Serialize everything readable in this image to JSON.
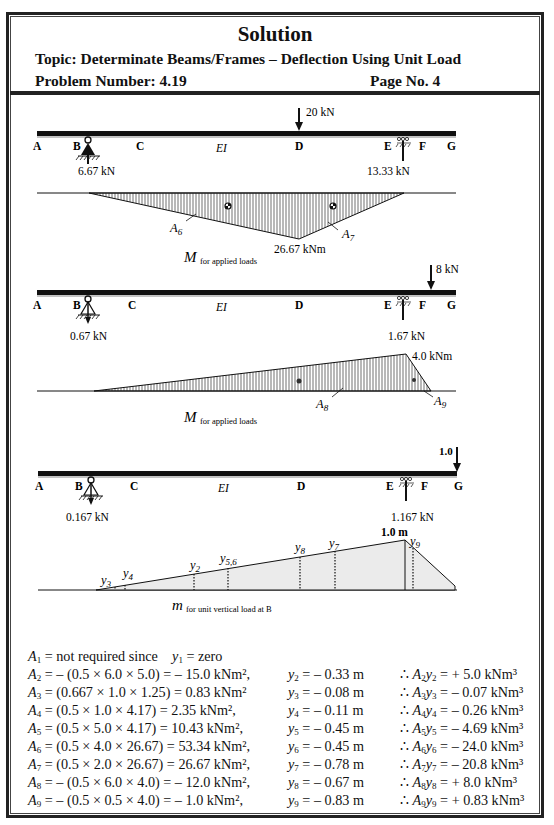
{
  "header": {
    "title": "Solution",
    "topic": "Topic:  Determinate Beams/Frames – Deflection Using Unit Load",
    "problem_number": "Problem Number: 4.19",
    "page_no": "Page No. 4"
  },
  "figures": {
    "fig1": {
      "load_label": "20 kN",
      "node_labels": [
        "A",
        "B",
        "C",
        "EI",
        "D",
        "E",
        "F",
        "G"
      ],
      "reaction_b": "6.67 kN",
      "reaction_e": "13.33 kN",
      "peak_moment": "26.67 kNm",
      "area_labels": [
        "A6",
        "A7"
      ],
      "caption_main": "M",
      "caption_sub": "for applied loads"
    },
    "fig2": {
      "load_label": "8 kN",
      "node_labels": [
        "A",
        "B",
        "C",
        "EI",
        "D",
        "E",
        "F",
        "G"
      ],
      "reaction_b": "0.67 kN",
      "reaction_e": "1.67 kN",
      "peak_moment": "4.0 kNm",
      "area_labels": [
        "A8",
        "A9"
      ],
      "caption_main": "M",
      "caption_sub": "for applied loads"
    },
    "fig3": {
      "load_label": "1.0",
      "node_labels": [
        "A",
        "B",
        "C",
        "EI",
        "D",
        "E",
        "F",
        "G"
      ],
      "reaction_b": "0.167 kN",
      "reaction_e": "1.167 kN",
      "peak_moment": "1.0 m",
      "ordinate_labels": [
        "y3",
        "y4",
        "y2",
        "y5,6",
        "y8",
        "y7",
        "y9"
      ],
      "caption_main": "m",
      "caption_sub": "for unit vertical load at B"
    }
  },
  "equations": {
    "areas": [
      {
        "lhs": "A1",
        "rhs": "= not required since",
        "extra": "y1 = zero"
      },
      {
        "lhs": "A2",
        "rhs": "= – (0.5 × 6.0 × 5.0) = – 15.0 kNm², "
      },
      {
        "lhs": "A3",
        "rhs": "= (0.667 × 1.0 × 1.25) = 0.83 kNm²"
      },
      {
        "lhs": "A4",
        "rhs": "= (0.5 × 1.0 × 4.17) = 2.35 kNm², "
      },
      {
        "lhs": "A5",
        "rhs": "= (0.5 × 5.0 × 4.17) = 10.43 kNm², "
      },
      {
        "lhs": "A6",
        "rhs": "= (0.5 × 4.0  × 26.67) = 53.34 kNm², "
      },
      {
        "lhs": "A7",
        "rhs": "= (0.5 × 2.0 × 26.67) = 26.67 kNm², "
      },
      {
        "lhs": "A8",
        "rhs": "= – (0.5 × 6.0 × 4.0) = – 12.0 kNm², "
      },
      {
        "lhs": "A9",
        "rhs": "= – (0.5 × 0.5 × 4.0) = – 1.0 kNm², "
      }
    ],
    "ordinates": [
      {
        "lhs": "y2",
        "rhs": "= – 0.33 m"
      },
      {
        "lhs": "y3",
        "rhs": "= – 0.08 m"
      },
      {
        "lhs": "y4",
        "rhs": "= – 0.11 m"
      },
      {
        "lhs": "y5",
        "rhs": "= – 0.45 m"
      },
      {
        "lhs": "y6",
        "rhs": "= – 0.45 m"
      },
      {
        "lhs": "y7",
        "rhs": "= – 0.78 m"
      },
      {
        "lhs": "y8",
        "rhs": "= – 0.67 m"
      },
      {
        "lhs": "y9",
        "rhs": "= – 0.83 m"
      }
    ],
    "products": [
      {
        "lhs": "∴ A2y2",
        "rhs": "= + 5.0 kNm³"
      },
      {
        "lhs": "∴ A3y3",
        "rhs": "= – 0.07 kNm³"
      },
      {
        "lhs": "∴ A4y4",
        "rhs": "= – 0.26 kNm³"
      },
      {
        "lhs": "∴ A5y5",
        "rhs": "= – 4.69 kNm³"
      },
      {
        "lhs": "∴ A6y6",
        "rhs": "= – 24.0 kNm³"
      },
      {
        "lhs": "∴ A7y7",
        "rhs": "= – 20.8 kNm³"
      },
      {
        "lhs": "∴ A8y8",
        "rhs": "= + 8.0 kNm³"
      },
      {
        "lhs": "∴ A9y9",
        "rhs": "= + 0.83 kNm³"
      }
    ]
  }
}
